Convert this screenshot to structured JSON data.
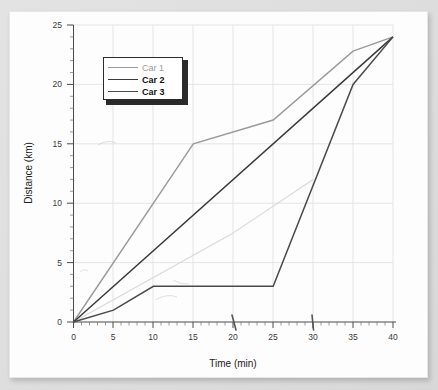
{
  "figure": {
    "background_color": "#dcdcdc",
    "paper_color": "#fdfdfd"
  },
  "legend": {
    "position": "upper-left",
    "entries": [
      {
        "label": "Car 1",
        "color": "#9a9a9a",
        "text_color": "#9a9a9a",
        "width": 1.4
      },
      {
        "label": "Car 2",
        "color": "#3a3a3a",
        "text_color": "#1a1a1a",
        "width": 1.5
      },
      {
        "label": "Car 3",
        "color": "#4a4a4a",
        "text_color": "#1a1a1a",
        "width": 1.5
      }
    ]
  },
  "axes": {
    "xlabel": "Time (min)",
    "ylabel": "Distance (km)",
    "xticks": [
      "0",
      "5",
      "10",
      "15",
      "20",
      "25",
      "30",
      "35",
      "40"
    ],
    "yticks": [
      "0",
      "5",
      "10",
      "15",
      "20",
      "25"
    ],
    "xlim": [
      0,
      40
    ],
    "ylim": [
      0,
      25
    ],
    "grid": true
  },
  "chart_data": {
    "type": "line",
    "title": "",
    "xlabel": "Time (min)",
    "ylabel": "Distance (km)",
    "xlim": [
      0,
      40
    ],
    "ylim": [
      0,
      25
    ],
    "xticks": [
      0,
      5,
      10,
      15,
      20,
      25,
      30,
      35,
      40
    ],
    "yticks": [
      0,
      5,
      10,
      15,
      20,
      25
    ],
    "xtick_minor_step": 1,
    "ytick_minor_step": 1,
    "grid": true,
    "legend_position": "upper-left",
    "series": [
      {
        "name": "Car 1",
        "color": "#9a9a9a",
        "x": [
          0,
          15,
          25,
          35,
          40
        ],
        "y": [
          0,
          15,
          17,
          22.8,
          24
        ]
      },
      {
        "name": "Car 2",
        "color": "#3a3a3a",
        "x": [
          0,
          40
        ],
        "y": [
          0,
          24
        ]
      },
      {
        "name": "Car 3",
        "color": "#4a4a4a",
        "x": [
          0,
          5,
          10,
          25,
          35,
          40
        ],
        "y": [
          0,
          1,
          3,
          3,
          20,
          24
        ]
      }
    ],
    "artifacts": {
      "ghost_line": {
        "description": "faint scanned ghost trace",
        "x": [
          0,
          20,
          30
        ],
        "y": [
          0,
          7.5,
          12
        ]
      },
      "pen_marks_x": [
        20,
        30
      ]
    }
  }
}
